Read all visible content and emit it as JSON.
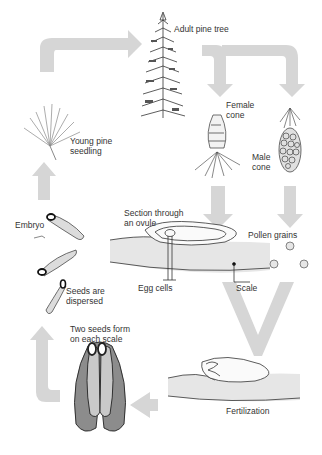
{
  "colors": {
    "arrow": "#d4d4d4",
    "ink": "#333333",
    "tissue": "#e2e2e2",
    "seed_outer": "#8a8a8a",
    "seed_inner": "#c8c8c8"
  },
  "stages": {
    "adult_tree": "Adult pine tree",
    "female_cone": [
      "Female",
      "cone"
    ],
    "male_cone": [
      "Male",
      "cone"
    ],
    "ovule_section": [
      "Section through",
      "an ovule"
    ],
    "pollen": "Pollen grains",
    "egg_cells": "Egg cells",
    "scale": "Scale",
    "fertilization": "Fertilization",
    "two_seeds": [
      "Two seeds form",
      "on each scale"
    ],
    "seeds_dispersed": [
      "Seeds are",
      "dispersed"
    ],
    "embryo": "Embryo",
    "seedling": [
      "Young pine",
      "seedling"
    ]
  }
}
